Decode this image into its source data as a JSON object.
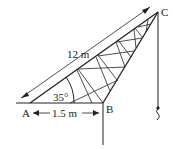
{
  "diagram": {
    "points": {
      "A": "A",
      "B": "B",
      "C": "C"
    },
    "labels": {
      "length_ac": "12 m",
      "length_ab": "1.5 m",
      "angle_a": "35°"
    }
  }
}
